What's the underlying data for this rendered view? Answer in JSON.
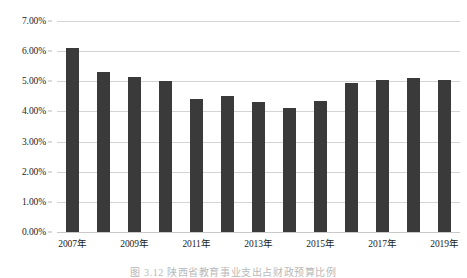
{
  "chart_data": {
    "type": "bar",
    "title": "",
    "xlabel": "",
    "ylabel": "",
    "ylim": [
      0,
      7
    ],
    "ytick_labels": [
      "0.00%",
      "1.00%",
      "2.00%",
      "3.00%",
      "4.00%",
      "5.00%",
      "6.00%",
      "7.00%"
    ],
    "ytick_values": [
      0,
      1,
      2,
      3,
      4,
      5,
      6,
      7
    ],
    "grid": true,
    "legend": "none",
    "bar_color": "#3a3a3a",
    "gridline_color": "#d4d4d4",
    "categories": [
      "2007年",
      "2008年",
      "2009年",
      "2010年",
      "2011年",
      "2012年",
      "2013年",
      "2014年",
      "2015年",
      "2016年",
      "2017年",
      "2018年",
      "2019年"
    ],
    "xtick_labels_shown": [
      "2007年",
      "2009年",
      "2011年",
      "2013年",
      "2015年",
      "2017年",
      "2019年"
    ],
    "values": [
      6.1,
      5.32,
      5.13,
      5.02,
      4.4,
      4.52,
      4.3,
      4.13,
      4.33,
      4.95,
      5.05,
      5.12,
      5.03
    ],
    "value_unit": "%"
  },
  "caption": "图 3.12  陕西省教育事业支出占财政预算比例"
}
